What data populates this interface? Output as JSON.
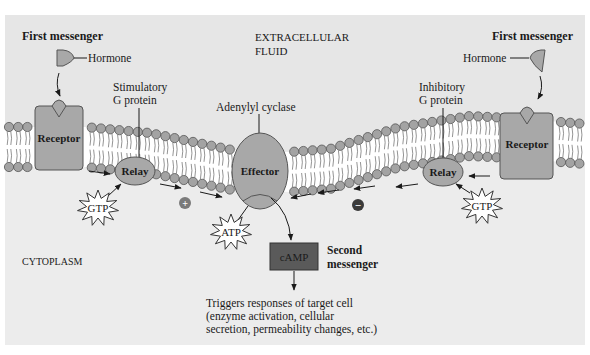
{
  "diagram": {
    "colors": {
      "background_panel": "#e6e6e6",
      "cytoplasm": "#ececec",
      "membrane_interior": "#ffffff",
      "lipid_head": "#a3a3a3",
      "lipid_head_stroke": "#555555",
      "protein_fill": "#a8a8a8",
      "protein_stroke": "#555555",
      "camp_fill": "#5a5a5a",
      "text": "#1a1a1a",
      "plus_minus_fill": "#7a7a7a",
      "minus_fill": "#3a3a3a"
    },
    "regions": {
      "extracellular_line1": "EXTRACELLULAR",
      "extracellular_line2": "FLUID",
      "cytoplasm": "CYTOPLASM"
    },
    "left_pathway": {
      "first_messenger_label": "First messenger",
      "hormone_label": "Hormone",
      "receptor_label": "Receptor",
      "g_protein_label_line1": "Stimulatory",
      "g_protein_label_line2": "G protein",
      "relay_label": "Relay",
      "gtp_label": "GTP",
      "sign": "+"
    },
    "right_pathway": {
      "first_messenger_label": "First messenger",
      "hormone_label": "Hormone",
      "receptor_label": "Receptor",
      "g_protein_label_line1": "Inhibitory",
      "g_protein_label_line2": "G protein",
      "relay_label": "Relay",
      "gtp_label": "GTP",
      "sign": "−"
    },
    "effector": {
      "enzyme_label": "Adenylyl cyclase",
      "label": "Effector",
      "substrate_label": "ATP"
    },
    "second_messenger": {
      "box_label": "cAMP",
      "label_line1": "Second",
      "label_line2": "messenger"
    },
    "response": {
      "line1": "Triggers responses of target cell",
      "line2": "(enzyme activation, cellular",
      "line3": "secretion, permeability changes, etc.)"
    }
  }
}
